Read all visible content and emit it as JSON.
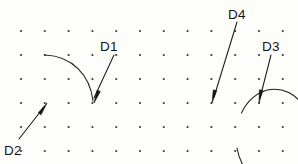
{
  "figure": {
    "background_color": "#fdfdfb",
    "ink_color": "#141414",
    "dot_color": "#3a3a3a",
    "width": 298,
    "height": 164
  },
  "grid": {
    "name": "dot-grid",
    "columns": 12,
    "rows": 6,
    "x_start": 21,
    "y_start": 31,
    "x_spacing": 23.8,
    "y_spacing": 24,
    "dot_radius": 1.1
  },
  "labels": [
    {
      "id": "D1",
      "text": "D1",
      "x": 100,
      "y": 51
    },
    {
      "id": "D2",
      "text": "D2",
      "x": 4,
      "y": 155
    },
    {
      "id": "D3",
      "text": "D3",
      "x": 262,
      "y": 51
    },
    {
      "id": "D4",
      "text": "D4",
      "x": 228,
      "y": 19
    }
  ],
  "geometry": [
    {
      "name": "open-arc-left",
      "type": "arc",
      "path": "M 45 55 C 72 56 90 75 93 101",
      "start": [
        45,
        55
      ],
      "end": [
        93,
        101
      ]
    },
    {
      "name": "large-circle-right",
      "type": "arc",
      "path": "M 237 148 A 38.5 48.5 0 1 0 241.5 113",
      "center": [
        207,
        100
      ],
      "radius_x": 38.5,
      "radius_y": 48.5,
      "gap": "lower-right"
    }
  ],
  "leaders": [
    {
      "name": "leader-d1",
      "from": [
        114,
        55
      ],
      "to": [
        94,
        98
      ],
      "arrow_at": [
        94,
        103
      ],
      "arrow_angle": 115
    },
    {
      "name": "leader-d2",
      "from": [
        19,
        139
      ],
      "to": [
        44,
        107
      ],
      "arrow_at": [
        47,
        103
      ],
      "arrow_angle": -52
    },
    {
      "name": "leader-d3",
      "from": [
        271,
        55
      ],
      "to": [
        260,
        98
      ],
      "arrow_at": [
        259,
        103
      ],
      "arrow_angle": 103
    },
    {
      "name": "leader-d4",
      "from": [
        237,
        22
      ],
      "to": [
        214,
        97
      ],
      "arrow_at": [
        212,
        103
      ],
      "arrow_angle": 107
    }
  ]
}
